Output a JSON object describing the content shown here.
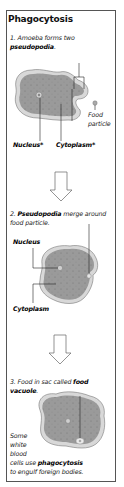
{
  "title": "Phagocytosis",
  "steps": [
    {
      "number": "1.",
      "text_before": "Amoeba forms two ",
      "bold": "pseudopodia",
      "text_after": ".",
      "labels": {
        "nucleus": "Nucleus*",
        "cytoplasm": "Cytoplasm*",
        "food_line1": "Food",
        "food_line2": "particle"
      }
    },
    {
      "number": "2.",
      "bold": "Pseudopodia",
      "text_after": " merge around food particle.",
      "labels": {
        "nucleus": "Nucleus",
        "cytoplasm": "Cytoplasm"
      }
    },
    {
      "number": "3.",
      "text_before": "Food in sac called ",
      "bold": "food vacuole",
      "text_after": ".",
      "note_before": "Some white blood cells use ",
      "note_bold": "phagocytosis",
      "note_after": " to engulf foreign bodies.",
      "note_lines": [
        "Some",
        "white",
        "blood"
      ],
      "note_line4_before": "cells use ",
      "note_line5": "to engulf foreign bodies."
    }
  ],
  "colors": {
    "border": "#555555",
    "cell_fill": "#9a9a9a",
    "cell_inner": "#8a8a8a",
    "membrane": "#d8d8d8",
    "arrow_fill": "#ffffff",
    "arrow_stroke": "#666666"
  }
}
